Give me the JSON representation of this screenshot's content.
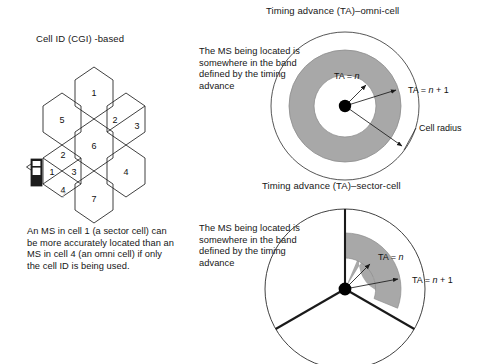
{
  "figure": {
    "width": 490,
    "height": 364,
    "background": "#ffffff"
  },
  "colors": {
    "line": "#2b2b2b",
    "band_gray": "#a8a8a8",
    "text": "#161616",
    "ghost": "#bdbdbd",
    "phone_body": "#1c1c1c",
    "center_dot": "#000000"
  },
  "cell_id_panel": {
    "title": "Cell ID (CGI) -based",
    "caption": "An MS in cell 1 (a sector cell) can\nbe more accurately located than an\nMS in cell 4 (an omni cell) if only\nthe cell ID is being used.",
    "ghost_label": "7",
    "omni_cells": [
      {
        "label": "1",
        "cx": 94,
        "cy": 93
      },
      {
        "label": "5",
        "cx": 62,
        "cy": 120
      },
      {
        "label": "6",
        "cx": 94,
        "cy": 146
      },
      {
        "label": "4",
        "cx": 126,
        "cy": 172
      },
      {
        "label": "7",
        "cx": 94,
        "cy": 199
      }
    ],
    "sector_cells": [
      {
        "name": "half-sectored-cell",
        "cx": 126,
        "cy": 120,
        "sectors": [
          {
            "label": "2",
            "lx": 114,
            "ly": 120
          },
          {
            "label": "3",
            "lx": 138,
            "ly": 126
          }
        ]
      },
      {
        "name": "quad-sectored-cell",
        "cx": 62,
        "cy": 172,
        "sectors": [
          {
            "label": "1",
            "lx": 51,
            "ly": 172
          },
          {
            "label": "2",
            "lx": 62,
            "ly": 154
          },
          {
            "label": "3",
            "lx": 74,
            "ly": 172
          },
          {
            "label": "4",
            "lx": 62,
            "ly": 190
          }
        ]
      }
    ],
    "mobile_station": {
      "name": "mobile-phone-icon",
      "x": 31,
      "y": 159
    }
  },
  "omni_panel": {
    "title": "Timing advance (TA)–omni-cell",
    "description": "The MS being located is\nsomewhere in the band\ndefined by the timing\nadvance",
    "center": {
      "cx": 345,
      "cy": 106
    },
    "radii": {
      "inner": 31,
      "outer_band": 56,
      "cell": 74
    },
    "labels": {
      "ta_n": "TA = ",
      "ta_n_var": "n",
      "ta_n1": "TA = ",
      "ta_n1_var": "n",
      "ta_n1_suffix": " + 1",
      "cell_radius": "Cell radius"
    }
  },
  "sector_panel": {
    "title": "Timing advance (TA)–sector-cell",
    "description": "The MS being located is\nsomewhere in the band\ndefined by the timing\nadvance",
    "center": {
      "cx": 345,
      "cy": 289
    },
    "radii": {
      "inner": 31,
      "outer_band": 56,
      "cell": 80
    },
    "sector_boundaries_deg": [
      90,
      210,
      330
    ],
    "band_sector_deg": [
      20,
      90
    ],
    "labels": {
      "ta_n": "TA = ",
      "ta_n_var": "n",
      "ta_n1": "TA = ",
      "ta_n1_var": "n",
      "ta_n1_suffix": " + 1"
    }
  }
}
